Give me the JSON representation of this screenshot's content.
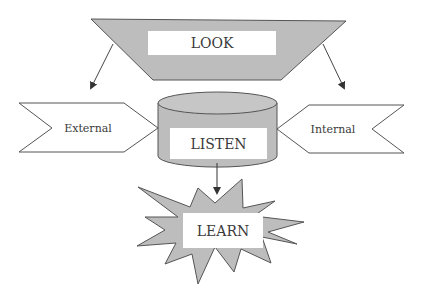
{
  "diagram": {
    "nodes": {
      "look": {
        "label": "LOOK",
        "shape": "trapezoid"
      },
      "listen": {
        "label": "LISTEN",
        "shape": "cylinder"
      },
      "learn": {
        "label": "LEARN",
        "shape": "explosion"
      },
      "external": {
        "label": "External",
        "shape": "chevron-right"
      },
      "internal": {
        "label": "Internal",
        "shape": "chevron-left"
      }
    },
    "edges": [
      {
        "from": "look",
        "to": "external"
      },
      {
        "from": "look",
        "to": "internal"
      },
      {
        "from": "listen",
        "to": "learn"
      }
    ],
    "colors": {
      "fill": "#bdbdbd",
      "stroke": "#555555",
      "label_bg": "#ffffff",
      "text": "#3a3a3a"
    }
  }
}
